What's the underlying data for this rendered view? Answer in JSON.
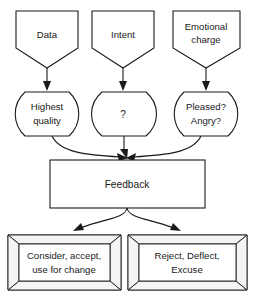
{
  "diagram": {
    "type": "flowchart",
    "colors": {
      "stroke": "#1a1a1a",
      "fill": "#ffffff",
      "bevel_fill": "#f4f4f4"
    },
    "inputs": [
      {
        "id": "data",
        "label": "Data",
        "shape": "pentagon-down"
      },
      {
        "id": "intent",
        "label": "Intent",
        "shape": "pentagon-down"
      },
      {
        "id": "emotional-charge",
        "label_line1": "Emotional",
        "label_line2": "charge",
        "shape": "pentagon-down"
      }
    ],
    "qualifiers": [
      {
        "id": "highest-quality",
        "label_line1": "Highest",
        "label_line2": "quality",
        "shape": "barrel"
      },
      {
        "id": "unknown",
        "label_line1": "?",
        "label_line2": "",
        "shape": "barrel"
      },
      {
        "id": "pleased-angry",
        "label_line1": "Pleased?",
        "label_line2": "Angry?",
        "shape": "barrel"
      }
    ],
    "merge": {
      "id": "feedback",
      "label": "Feedback",
      "shape": "rectangle"
    },
    "outcomes": [
      {
        "id": "accept",
        "label_line1": "Consider, accept,",
        "label_line2": "use for change",
        "shape": "beveled-box"
      },
      {
        "id": "reject",
        "label_line1": "Reject, Deflect,",
        "label_line2": "Excuse",
        "shape": "beveled-box"
      }
    ],
    "edges": [
      {
        "from": "data",
        "to": "highest-quality",
        "style": "straight-arrow"
      },
      {
        "from": "intent",
        "to": "unknown",
        "style": "straight-arrow"
      },
      {
        "from": "emotional-charge",
        "to": "pleased-angry",
        "style": "straight-arrow"
      },
      {
        "from": "highest-quality",
        "to": "feedback",
        "style": "curved-arrow"
      },
      {
        "from": "unknown",
        "to": "feedback",
        "style": "straight-arrow"
      },
      {
        "from": "pleased-angry",
        "to": "feedback",
        "style": "curved-arrow"
      },
      {
        "from": "feedback",
        "to": "accept",
        "style": "curved-arrow"
      },
      {
        "from": "feedback",
        "to": "reject",
        "style": "curved-arrow"
      }
    ]
  }
}
